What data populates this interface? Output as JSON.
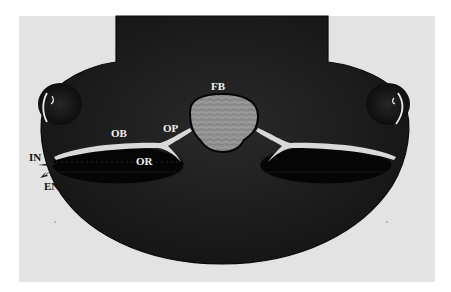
{
  "figure": {
    "type": "anatomical-schematic",
    "colors": {
      "background": "#ffffff",
      "panel": "#e3e3e3",
      "head": "#1a1a1a",
      "head_edge": "#0a0a0a",
      "forebrain_fill": "#8e8e8e",
      "nerve": "#d9d9d9",
      "label_light": "#f2f2f2",
      "label_dark": "#111111"
    },
    "labels": {
      "fb": "FB",
      "op": "OP",
      "ob": "OB",
      "or": "OR",
      "in": "IN",
      "en": "EN"
    }
  }
}
